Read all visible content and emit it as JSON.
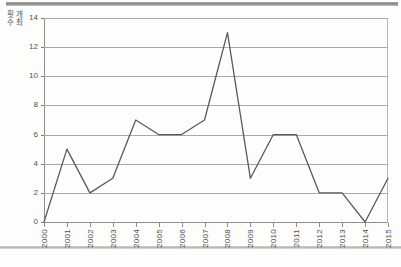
{
  "chart_data": {
    "type": "line",
    "title": "",
    "xlabel": "",
    "ylabel": "개최\n횟수",
    "categories": [
      "2000",
      "2001",
      "2002",
      "2003",
      "2004",
      "2005",
      "2006",
      "2007",
      "2008",
      "2009",
      "2010",
      "2011",
      "2012",
      "2013",
      "2014",
      "2015"
    ],
    "values": [
      0,
      5,
      2,
      3,
      7,
      6,
      6,
      7,
      13,
      3,
      6,
      6,
      2,
      2,
      0,
      3
    ],
    "series": [
      {
        "name": "개최 횟수",
        "values": [
          0,
          5,
          2,
          3,
          7,
          6,
          6,
          7,
          13,
          3,
          6,
          6,
          2,
          2,
          0,
          3
        ]
      }
    ],
    "ylim": [
      0,
      14
    ],
    "yticks": [
      0,
      2,
      4,
      6,
      8,
      10,
      12,
      14
    ],
    "ytick_labels": [
      "0",
      "2",
      "4",
      "6",
      "8",
      "10",
      "12",
      "14"
    ],
    "grid": true,
    "grid_axis": "y",
    "legend": false,
    "legend_position": "none",
    "line_color": "#5a5a5a",
    "grid_color": "#a9a9a9",
    "axis_color": "#8d8d8d",
    "background_color": "#fdfdfc",
    "markers": false,
    "annotations": []
  },
  "axis": {
    "y_title_line1": "개최",
    "y_title_line2": "횟수"
  }
}
